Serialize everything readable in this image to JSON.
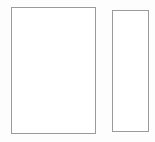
{
  "canvas": {
    "width": 155,
    "height": 142,
    "background_color": "#fdfdfd",
    "content_description": "Two empty outlined rectangles side by side on a white background"
  },
  "shapes": [
    {
      "name": "large-rectangle",
      "label": "",
      "type": "rectangle",
      "x": 11,
      "y": 7,
      "width": 85,
      "height": 127,
      "fill_color": "#ffffff",
      "stroke_color": "#9a9a9a",
      "stroke_width": 1
    },
    {
      "name": "narrow-rectangle",
      "label": "",
      "type": "rectangle",
      "x": 112,
      "y": 10,
      "width": 37,
      "height": 122,
      "fill_color": "#ffffff",
      "stroke_color": "#9b9b9b",
      "stroke_width": 1
    }
  ]
}
